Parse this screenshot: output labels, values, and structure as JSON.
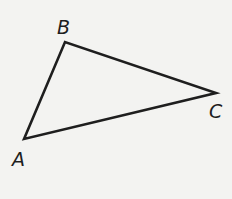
{
  "figure": {
    "type": "triangle",
    "vertices": [
      {
        "label": "A",
        "x": 24,
        "y": 139
      },
      {
        "label": "B",
        "x": 65,
        "y": 42
      },
      {
        "label": "C",
        "x": 216,
        "y": 93
      }
    ],
    "labels": {
      "A": "A",
      "B": "B",
      "C": "C"
    },
    "stroke_color": "#1e1e1e",
    "background": "#f3f3f1"
  }
}
